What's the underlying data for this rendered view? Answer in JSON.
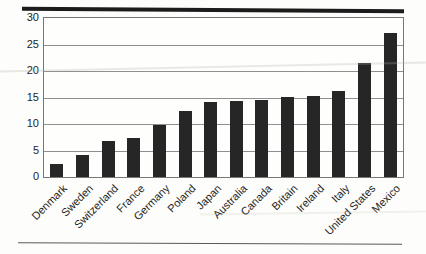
{
  "figure": {
    "background_color": "#fdfdfb",
    "top_rule_color": "#1c1c1c",
    "bottom_rule_color": "#5a5a5a"
  },
  "chart_data": {
    "type": "bar",
    "title": "",
    "xlabel": "",
    "ylabel": "",
    "categories": [
      "Denmark",
      "Sweden",
      "Switzerland",
      "France",
      "Germany",
      "Poland",
      "Japan",
      "Australia",
      "Canada",
      "Britain",
      "Ireland",
      "Italy",
      "United States",
      "Mexico"
    ],
    "values": [
      2.5,
      4.2,
      6.8,
      7.4,
      9.9,
      12.5,
      14.1,
      14.4,
      14.5,
      15.1,
      15.3,
      16.3,
      21.5,
      27.2
    ],
    "y_ticks": [
      0,
      5,
      10,
      15,
      20,
      25,
      30
    ],
    "ylim": [
      0,
      30
    ],
    "grid": "horizontal",
    "legend": "none",
    "bar_color": "#262626",
    "gridline_color": "#8f8f8f",
    "axis_color": "#777777",
    "tick_label_color": "#1e1e1e",
    "x_label_rotation_deg": -45
  }
}
